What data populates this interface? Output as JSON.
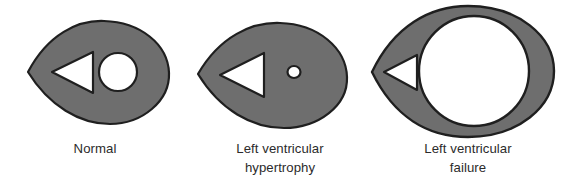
{
  "figure": {
    "name": "left-ventricle-cross-section-comparison",
    "background_color": "#ffffff",
    "wall_fill_color": "#6e6e6e",
    "outline_color": "#1f1f1f",
    "lumen_fill_color": "#ffffff",
    "caption_color": "#2b2b2b"
  },
  "panels": [
    {
      "id": "normal",
      "caption_line1": "Normal",
      "caption_line2": "",
      "shapes": {
        "myocardium": "teardrop-outline",
        "right-ventricle": "triangle-lumen",
        "left-ventricle": "circle-lumen"
      }
    },
    {
      "id": "hypertrophy",
      "caption_line1": "Left ventricular",
      "caption_line2": "hypertrophy",
      "shapes": {
        "myocardium": "teardrop-outline",
        "right-ventricle": "triangle-lumen",
        "left-ventricle": "small-circle-lumen"
      }
    },
    {
      "id": "failure",
      "caption_line1": "Left ventricular",
      "caption_line2": "failure",
      "shapes": {
        "myocardium": "teardrop-outline",
        "right-ventricle": "triangle-lumen",
        "left-ventricle": "large-circle-lumen"
      }
    }
  ]
}
